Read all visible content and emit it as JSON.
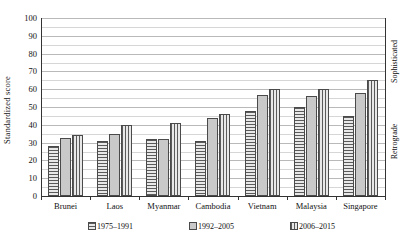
{
  "chart_data": {
    "type": "bar",
    "title": "",
    "xlabel": "",
    "ylabel": "Standardized score",
    "ylim": [
      0,
      100
    ],
    "ytick_step": 10,
    "grid": true,
    "minor_grid": true,
    "legend_position": "bottom",
    "categories": [
      "Brunei",
      "Laos",
      "Myanmar",
      "Cambodia",
      "Vietnam",
      "Malaysia",
      "Singapore"
    ],
    "yticks": [
      "0",
      "10",
      "20",
      "30",
      "40",
      "50",
      "60",
      "70",
      "80",
      "90",
      "100"
    ],
    "series": [
      {
        "name": "1975–1991",
        "pattern": "horizontal-hatch",
        "values": [
          28,
          31,
          32,
          31,
          48,
          50,
          45
        ]
      },
      {
        "name": "1992–2005",
        "pattern": "solid-grey",
        "values": [
          32.5,
          35,
          32,
          44,
          57,
          56,
          58
        ]
      },
      {
        "name": "2006–2015",
        "pattern": "vertical-hatch",
        "values": [
          34,
          40,
          41,
          46,
          60,
          60,
          65
        ]
      }
    ],
    "annotations": [
      {
        "name": "sophisticated",
        "text": "Sophisticated",
        "position": "right-axis-top",
        "orientation": "vertical"
      },
      {
        "name": "retrograde",
        "text": "Retrograde",
        "position": "right-axis-bottom",
        "orientation": "vertical"
      }
    ]
  },
  "legend": {
    "items": [
      {
        "label": "1975–1991"
      },
      {
        "label": "1992–2005"
      },
      {
        "label": "2006–2015"
      }
    ]
  },
  "colors": {
    "axis": "#333333",
    "gridline": "#b9b9b9",
    "gridline_minor": "#d6d6d6",
    "bar_border": "#4a4a4a",
    "bar_fill_light": "#d9d9d9",
    "bar_fill_solid": "#c9c9c9",
    "hatch": "#5a5a5a",
    "text": "#111111",
    "background": "#ffffff"
  }
}
